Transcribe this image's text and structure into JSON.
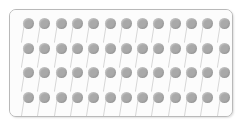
{
  "panel": {
    "name": "pin-array-panel",
    "background_color": "#fcfcfc",
    "border_color": "#b9b9b9",
    "border_radius_px": 7,
    "x": 9,
    "y": 9,
    "width": 224,
    "height": 108
  },
  "grid": {
    "rows": 4,
    "columns": 13,
    "total_items": 52,
    "item_name": "pin",
    "origin_x": 13,
    "origin_y": 8,
    "step_x": 16.3,
    "step_y": 24.5
  },
  "pin": {
    "head_color": "#a9a9a9",
    "head_diameter_px": 11,
    "stem_color": "#d6d6d6",
    "stem_length_px": 20,
    "stem_angle_deg": 9,
    "stem_width_px": 1.2
  },
  "page": {
    "background_color": "#ffffff",
    "caption": "Array of 52 pins arranged in 4 rows of 13"
  }
}
